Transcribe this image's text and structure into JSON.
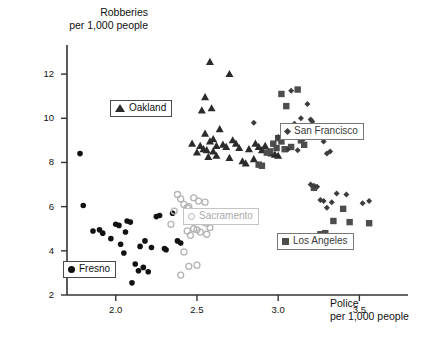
{
  "chart_data": {
    "type": "scatter",
    "title": "",
    "xlabel": "Police\nper 1,000 people",
    "ylabel": "Robberies\nper 1,000 people",
    "xlabel_line1": "Police",
    "xlabel_line2": "per 1,000 people",
    "ylabel_line1": "Robberies",
    "ylabel_line2": "per 1,000 people",
    "xlim": [
      1.7,
      3.75
    ],
    "ylim": [
      2,
      13
    ],
    "xticks": [
      2.0,
      2.5,
      3.0,
      3.5
    ],
    "xtick_labels": [
      "2.0",
      "2.5",
      "3.0",
      "3.5"
    ],
    "yticks": [
      2,
      4,
      6,
      8,
      10,
      12
    ],
    "ytick_labels": [
      "2",
      "4",
      "6",
      "8",
      "10",
      "12"
    ],
    "grid": false,
    "legend_position": "inside-scattered",
    "series": [
      {
        "name": "Fresno",
        "marker": "circle-filled",
        "color": "#111111",
        "points": [
          [
            1.78,
            8.4
          ],
          [
            1.8,
            6.05
          ],
          [
            1.86,
            4.9
          ],
          [
            1.9,
            4.95
          ],
          [
            1.92,
            4.8
          ],
          [
            1.97,
            4.55
          ],
          [
            2.0,
            5.2
          ],
          [
            2.02,
            5.15
          ],
          [
            2.03,
            4.3
          ],
          [
            2.05,
            3.9
          ],
          [
            2.06,
            4.85
          ],
          [
            2.07,
            5.35
          ],
          [
            2.09,
            5.3
          ],
          [
            2.1,
            2.55
          ],
          [
            2.12,
            3.4
          ],
          [
            2.14,
            3.1
          ],
          [
            2.15,
            4.2
          ],
          [
            2.17,
            3.25
          ],
          [
            2.18,
            4.45
          ],
          [
            2.2,
            3.05
          ],
          [
            2.22,
            4.15
          ],
          [
            2.25,
            5.55
          ],
          [
            2.27,
            5.6
          ],
          [
            2.3,
            4.1
          ],
          [
            2.31,
            4.05
          ],
          [
            2.35,
            5.7
          ],
          [
            2.38,
            4.45
          ],
          [
            2.4,
            4.35
          ]
        ]
      },
      {
        "name": "Sacramento",
        "marker": "circle-open",
        "color": "#b4b4b4",
        "points": [
          [
            2.38,
            6.55
          ],
          [
            2.4,
            6.35
          ],
          [
            2.42,
            6.1
          ],
          [
            2.44,
            5.95
          ],
          [
            2.45,
            6.0
          ],
          [
            2.46,
            5.75
          ],
          [
            2.47,
            5.7
          ],
          [
            2.48,
            6.4
          ],
          [
            2.5,
            5.45
          ],
          [
            2.51,
            6.25
          ],
          [
            2.52,
            5.4
          ],
          [
            2.53,
            5.35
          ],
          [
            2.54,
            5.3
          ],
          [
            2.55,
            6.2
          ],
          [
            2.56,
            5.25
          ],
          [
            2.44,
            4.9
          ],
          [
            2.46,
            4.7
          ],
          [
            2.48,
            5.0
          ],
          [
            2.5,
            4.95
          ],
          [
            2.52,
            4.85
          ],
          [
            2.56,
            4.75
          ],
          [
            2.42,
            3.95
          ],
          [
            2.45,
            3.3
          ],
          [
            2.5,
            3.35
          ],
          [
            2.4,
            2.9
          ],
          [
            2.36,
            5.8
          ],
          [
            2.58,
            5.05
          ],
          [
            2.34,
            5.2
          ]
        ]
      },
      {
        "name": "Oakland",
        "marker": "triangle",
        "color": "#2b2b2b",
        "points": [
          [
            2.58,
            12.55
          ],
          [
            2.7,
            12.0
          ],
          [
            2.55,
            10.95
          ],
          [
            2.53,
            10.35
          ],
          [
            2.59,
            10.45
          ],
          [
            2.47,
            8.85
          ],
          [
            2.55,
            9.3
          ],
          [
            2.58,
            8.95
          ],
          [
            2.6,
            9.05
          ],
          [
            2.62,
            8.75
          ],
          [
            2.64,
            9.5
          ],
          [
            2.66,
            8.8
          ],
          [
            2.68,
            8.7
          ],
          [
            2.52,
            8.75
          ],
          [
            2.54,
            8.6
          ],
          [
            2.56,
            8.55
          ],
          [
            2.5,
            8.45
          ],
          [
            2.6,
            8.5
          ],
          [
            2.62,
            8.3
          ],
          [
            2.57,
            8.25
          ],
          [
            2.72,
            9.0
          ],
          [
            2.74,
            8.85
          ],
          [
            2.76,
            8.65
          ],
          [
            2.7,
            8.2
          ],
          [
            2.78,
            8.05
          ],
          [
            2.82,
            8.6
          ],
          [
            2.86,
            8.85
          ],
          [
            2.88,
            8.7
          ],
          [
            2.9,
            8.55
          ],
          [
            2.94,
            8.45
          ],
          [
            2.96,
            8.4
          ],
          [
            2.98,
            8.35
          ],
          [
            3.0,
            8.3
          ],
          [
            2.92,
            8.75
          ],
          [
            2.85,
            8.15
          ],
          [
            2.8,
            7.95
          ]
        ]
      },
      {
        "name": "Los Angeles",
        "marker": "square",
        "color": "#4d4d4d",
        "points": [
          [
            3.02,
            11.1
          ],
          [
            3.12,
            11.3
          ],
          [
            3.05,
            10.55
          ],
          [
            3.1,
            9.55
          ],
          [
            3.0,
            9.1
          ],
          [
            3.06,
            9.2
          ],
          [
            3.14,
            9.0
          ],
          [
            3.02,
            8.95
          ],
          [
            2.97,
            8.85
          ],
          [
            2.99,
            8.65
          ],
          [
            3.04,
            8.6
          ],
          [
            2.95,
            8.5
          ],
          [
            2.93,
            8.45
          ],
          [
            2.88,
            7.9
          ],
          [
            2.9,
            7.85
          ],
          [
            3.22,
            6.85
          ],
          [
            3.4,
            5.9
          ],
          [
            3.34,
            5.35
          ],
          [
            3.44,
            5.3
          ],
          [
            3.56,
            5.25
          ],
          [
            3.26,
            4.75
          ],
          [
            3.29,
            4.8
          ],
          [
            3.31,
            4.6
          ],
          [
            3.18,
            4.55
          ],
          [
            3.08,
            8.7
          ],
          [
            3.16,
            8.8
          ]
        ]
      },
      {
        "name": "San Francisco",
        "marker": "diamond",
        "color": "#3d3d3d",
        "points": [
          [
            3.08,
            11.25
          ],
          [
            3.18,
            10.65
          ],
          [
            3.14,
            10.0
          ],
          [
            3.2,
            9.95
          ],
          [
            3.21,
            9.85
          ],
          [
            3.1,
            9.75
          ],
          [
            2.85,
            9.8
          ],
          [
            3.24,
            9.6
          ],
          [
            3.26,
            9.55
          ],
          [
            3.0,
            9.15
          ],
          [
            3.16,
            9.1
          ],
          [
            3.28,
            8.95
          ],
          [
            3.06,
            8.6
          ],
          [
            3.12,
            8.55
          ],
          [
            3.32,
            8.5
          ],
          [
            3.3,
            8.4
          ],
          [
            3.22,
            6.95
          ],
          [
            3.24,
            6.9
          ],
          [
            3.36,
            6.6
          ],
          [
            3.42,
            6.55
          ],
          [
            3.26,
            6.3
          ],
          [
            3.28,
            6.25
          ],
          [
            3.33,
            6.2
          ],
          [
            3.52,
            6.15
          ],
          [
            3.56,
            6.25
          ],
          [
            3.3,
            5.95
          ],
          [
            3.2,
            7.0
          ]
        ]
      }
    ],
    "legend_items": [
      {
        "name": "Oakland",
        "marker": "triangle",
        "style": "dark"
      },
      {
        "name": "San Francisco",
        "marker": "diamond",
        "style": "mid"
      },
      {
        "name": "Sacramento",
        "marker": "circle-open",
        "style": "gray"
      },
      {
        "name": "Los Angeles",
        "marker": "square",
        "style": "mid"
      },
      {
        "name": "Fresno",
        "marker": "circle-filled",
        "style": "dark"
      }
    ]
  }
}
